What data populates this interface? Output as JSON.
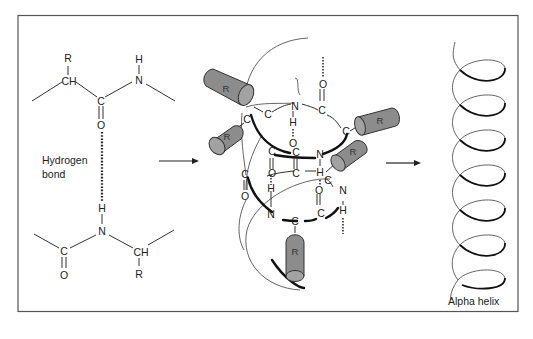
{
  "figure": {
    "frame": {
      "x": 18,
      "y": 15,
      "width": 500,
      "height": 296,
      "stroke": "#555555"
    },
    "colors": {
      "cylinder_fill": "#8c8c8c",
      "cylinder_end": "#a2a2a2",
      "line": "#222222"
    }
  },
  "left_panel": {
    "upper_residue": {
      "atoms": {
        "r": "R",
        "ch": "CH",
        "c": "C",
        "o": "O",
        "n": "N",
        "h": "H"
      }
    },
    "hydrogen_bond_label_line1": "Hydrogen",
    "hydrogen_bond_label_line2": "bond",
    "lower_residue": {
      "atoms": {
        "h": "H",
        "n": "N",
        "c": "C",
        "o": "O",
        "ch": "CH",
        "r": "R"
      }
    }
  },
  "arrows": [
    {
      "name": "arrow-1",
      "from": "peptide-bonds",
      "to": "helix-model"
    },
    {
      "name": "arrow-2",
      "from": "helix-model",
      "to": "alpha-helix"
    }
  ],
  "center_panel": {
    "side_chain_label": "R",
    "side_chains": [
      {
        "label": "R"
      },
      {
        "label": "R"
      },
      {
        "label": "R"
      },
      {
        "label": "R"
      },
      {
        "label": "R"
      }
    ],
    "atoms": {
      "c": "C",
      "n": "N",
      "o": "O",
      "h": "H"
    }
  },
  "right_panel": {
    "turns": 7,
    "caption": "Alpha helix"
  }
}
